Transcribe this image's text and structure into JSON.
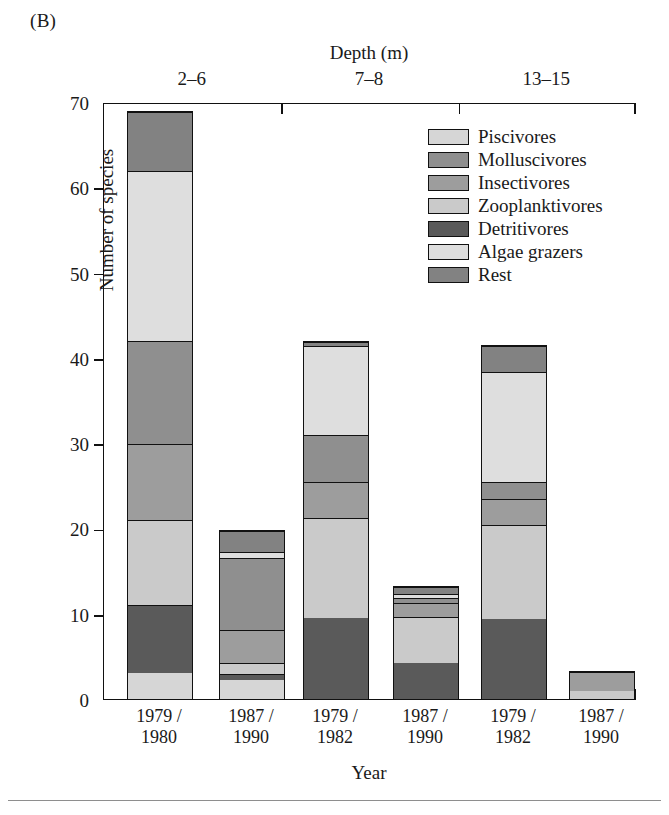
{
  "panel_label": "(B)",
  "legend": {
    "items": [
      {
        "label": "Piscivores",
        "color": "#d6d6d6"
      },
      {
        "label": "Molluscivores",
        "color": "#8f8f8f"
      },
      {
        "label": "Insectivores",
        "color": "#9d9d9d"
      },
      {
        "label": "Zooplanktivores",
        "color": "#cacaca"
      },
      {
        "label": "Detritivores",
        "color": "#5a5a5a"
      },
      {
        "label": "Algae grazers",
        "color": "#dedede"
      },
      {
        "label": "Rest",
        "color": "#828282"
      }
    ]
  },
  "axes": {
    "y_title": "Number of species",
    "x_title": "Year",
    "top_title": "Depth (m)",
    "y_ticks": [
      0,
      10,
      20,
      30,
      40,
      50,
      60,
      70
    ],
    "y_min": 0,
    "y_max": 70
  },
  "chart_data": {
    "type": "bar",
    "subtitle": "(B)",
    "xlabel": "Year",
    "ylabel": "Number of species",
    "ylim": [
      0,
      70
    ],
    "ytick_step": 10,
    "grid": false,
    "stacked": true,
    "legend_position": "top-right",
    "group_label": "Depth (m)",
    "groups": [
      "2–6",
      "7–8",
      "13–15"
    ],
    "categories": [
      "1979 / 1980",
      "1987 / 1990",
      "1979 / 1982",
      "1987 / 1990",
      "1979 / 1982",
      "1987 / 1990"
    ],
    "category_lines": [
      [
        "1979 /",
        "1980"
      ],
      [
        "1987 /",
        "1990"
      ],
      [
        "1979 /",
        "1982"
      ],
      [
        "1987 /",
        "1990"
      ],
      [
        "1979 /",
        "1982"
      ],
      [
        "1987 /",
        "1990"
      ]
    ],
    "category_group": [
      "2–6",
      "2–6",
      "7–8",
      "7–8",
      "13–15",
      "13–15"
    ],
    "series": [
      {
        "name": "Piscivores",
        "color": "#d6d6d6",
        "values": [
          3.0,
          2.2,
          0.0,
          0.0,
          0.0,
          0.0
        ]
      },
      {
        "name": "Detritivores",
        "color": "#5a5a5a",
        "values": [
          8.0,
          0.8,
          9.5,
          4.3,
          9.4,
          0.0
        ]
      },
      {
        "name": "Zooplanktivores",
        "color": "#cacaca",
        "values": [
          10.0,
          1.3,
          11.8,
          5.4,
          11.1,
          1.0
        ]
      },
      {
        "name": "Insectivores",
        "color": "#9d9d9d",
        "values": [
          9.0,
          3.9,
          4.2,
          1.6,
          3.0,
          2.3
        ]
      },
      {
        "name": "Molluscivores",
        "color": "#8f8f8f",
        "values": [
          12.0,
          8.4,
          5.5,
          0.6,
          2.0,
          0.0
        ]
      },
      {
        "name": "Algae grazers",
        "color": "#dedede",
        "values": [
          20.0,
          0.7,
          10.5,
          0.5,
          13.0,
          0.0
        ]
      },
      {
        "name": "Rest",
        "color": "#828282",
        "values": [
          7.0,
          2.5,
          0.5,
          0.9,
          3.0,
          0.0
        ]
      }
    ],
    "totals": [
      69.0,
      19.8,
      42.0,
      13.3,
      41.5,
      3.3
    ]
  }
}
